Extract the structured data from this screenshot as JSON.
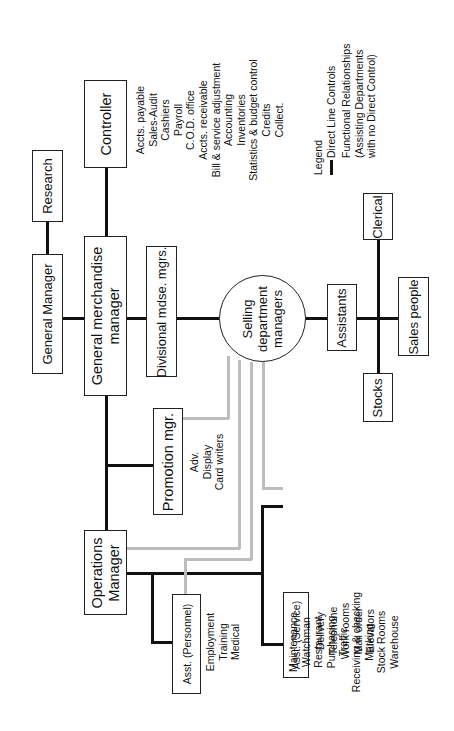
{
  "nodes": {
    "general_manager": "General Manager",
    "research": "Research",
    "general_merchandise_manager": [
      "General merchandise",
      "manager"
    ],
    "controller": "Controller",
    "divisional": "Divisional mdse. mgrs.",
    "selling": [
      "Selling",
      "department",
      "managers"
    ],
    "assistants": "Assistants",
    "clerical": "Clerical",
    "sales_people": "Sales people",
    "stocks": "Stocks",
    "promotion": "Promotion mgr.",
    "operations": [
      "Operations",
      "Manager"
    ],
    "asst_personnel": "Asst. (Personnel)",
    "asst_service": "Asst. (Service)"
  },
  "lists": {
    "controller": [
      "Accts. payable",
      "Sales-Audit",
      "Cashiers",
      "Payroll",
      "C.O.D. office",
      "Accts. receivable",
      "Bill & service adjustment",
      "Accounting",
      "Inventories",
      "Statistics & budget control",
      "Credits",
      "Collect."
    ],
    "promotion": [
      "Adv.",
      "Display",
      "Card writers"
    ],
    "personnel": [
      "Employment",
      "Training",
      "Medical"
    ],
    "service": [
      "Delivery",
      "Telephone",
      "Work rooms",
      "Mail order",
      "Elevators"
    ],
    "operations": [
      "Maintenance",
      "Watchman",
      "Restaurant",
      "Purchasing",
      "Traffic",
      "Receiving & checking",
      "Marking",
      "Stock Rooms",
      "Warehouse"
    ]
  },
  "legend": {
    "title": "Legend",
    "direct": "Direct Line Controls",
    "functional": [
      "Functional Relationships",
      "(Assisting Departments",
      "with no Direct Control)"
    ]
  },
  "colors": {
    "direct_line": "#111111",
    "functional_line": "#bdbdbd"
  }
}
